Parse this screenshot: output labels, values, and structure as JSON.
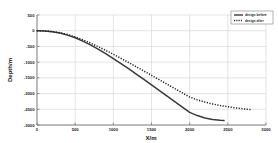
{
  "chart_data": {
    "type": "line",
    "title": "",
    "xlabel": "X/m",
    "ylabel": "Depth/m",
    "xlim": [
      0,
      3000
    ],
    "ylim": [
      -3000,
      500
    ],
    "xticks": [
      0,
      500,
      1000,
      1500,
      2000,
      2500,
      3000
    ],
    "xtick_labels": [
      "0",
      "500",
      "1000",
      "1500",
      "2000",
      "2500",
      "3000"
    ],
    "yticks": [
      500,
      0,
      -500,
      -1000,
      -1500,
      -2000,
      -2500,
      -3000
    ],
    "ytick_labels": [
      "500",
      "0",
      "-500",
      "-1000",
      "-1500",
      "-2000",
      "-2500",
      "-3000"
    ],
    "grid": true,
    "legend_position": "upper-right",
    "series": [
      {
        "name": "design before",
        "style": "solid",
        "color": "#3a3a3a",
        "x": [
          0,
          100,
          200,
          300,
          400,
          500,
          600,
          700,
          800,
          900,
          1000,
          1100,
          1200,
          1300,
          1400,
          1500,
          1600,
          1700,
          1800,
          1900,
          2000,
          2100,
          2200,
          2300,
          2400,
          2450
        ],
        "y": [
          0,
          -8,
          -32,
          -75,
          -140,
          -225,
          -330,
          -450,
          -585,
          -730,
          -885,
          -1045,
          -1210,
          -1380,
          -1550,
          -1725,
          -1900,
          -2075,
          -2250,
          -2425,
          -2600,
          -2700,
          -2775,
          -2825,
          -2850,
          -2860
        ]
      },
      {
        "name": "design after",
        "style": "dotted",
        "color": "#222222",
        "x": [
          0,
          100,
          200,
          300,
          400,
          500,
          600,
          700,
          800,
          900,
          1000,
          1100,
          1200,
          1300,
          1400,
          1500,
          1600,
          1700,
          1800,
          1900,
          2000,
          2100,
          2200,
          2300,
          2400,
          2500,
          2600,
          2700,
          2800
        ],
        "y": [
          0,
          -7,
          -28,
          -66,
          -122,
          -196,
          -288,
          -392,
          -505,
          -625,
          -750,
          -880,
          -1012,
          -1146,
          -1282,
          -1420,
          -1558,
          -1696,
          -1834,
          -1972,
          -2110,
          -2200,
          -2270,
          -2330,
          -2380,
          -2420,
          -2455,
          -2485,
          -2510
        ]
      }
    ]
  },
  "legend": {
    "entries": [
      {
        "label": "design before"
      },
      {
        "label": "design after"
      }
    ]
  },
  "axes": {
    "x_title": "X/m",
    "y_title": "Depth/m"
  }
}
